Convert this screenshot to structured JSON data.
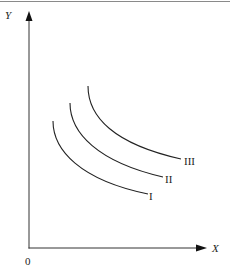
{
  "diagram": {
    "type": "indifference-curves",
    "axes": {
      "x_label": "X",
      "y_label": "Y",
      "origin_label": "0"
    },
    "curves": [
      {
        "label": "I"
      },
      {
        "label": "II"
      },
      {
        "label": "III"
      }
    ],
    "colors": {
      "line": "#222222",
      "border": "#888888",
      "background": "#ffffff"
    }
  }
}
